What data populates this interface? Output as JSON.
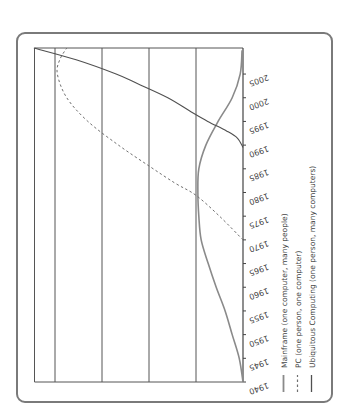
{
  "chart_data": {
    "type": "line",
    "orientation": "rotated-90-ccw",
    "title": "",
    "xlabel": "",
    "ylabel": "",
    "x": [
      1940,
      1945,
      1950,
      1955,
      1960,
      1965,
      1970,
      1975,
      1980,
      1985,
      1990,
      1995,
      2000,
      2005,
      2010
    ],
    "xticks": [
      "1940",
      "1945",
      "1950",
      "1955",
      "1960",
      "1965",
      "1970",
      "1975",
      "1980",
      "1985",
      "1990",
      "1995",
      "2000",
      "2005"
    ],
    "xlim": [
      1940,
      2010.5
    ],
    "ylim": [
      0,
      4.45
    ],
    "grid": {
      "y_gridlines": [
        1,
        2,
        3,
        4
      ]
    },
    "legend_position": "right (rotated, below axis labels)",
    "series": [
      {
        "name": "Mainframe (one computer, many people)",
        "style": "solid-light",
        "color": "#8a8a8a",
        "points": [
          [
            1940,
            0
          ],
          [
            1945,
            0.08
          ],
          [
            1950,
            0.23
          ],
          [
            1955,
            0.38
          ],
          [
            1960,
            0.57
          ],
          [
            1965,
            0.74
          ],
          [
            1970,
            0.89
          ],
          [
            1975,
            0.94
          ],
          [
            1980,
            0.96
          ],
          [
            1985,
            0.94
          ],
          [
            1990,
            0.79
          ],
          [
            1995,
            0.53
          ],
          [
            2000,
            0.23
          ],
          [
            2005,
            0.06
          ],
          [
            2010,
            0.02
          ]
        ]
      },
      {
        "name": "PC (one person, one computer)",
        "style": "dashed",
        "color": "#777777",
        "points": [
          [
            1970,
            0
          ],
          [
            1975,
            0.5
          ],
          [
            1979.4,
            1.0
          ],
          [
            1982,
            1.45
          ],
          [
            1985.6,
            2.0
          ],
          [
            1990,
            2.65
          ],
          [
            1995,
            3.3
          ],
          [
            2000,
            3.75
          ],
          [
            2005,
            3.95
          ],
          [
            2008,
            3.9
          ],
          [
            2010.5,
            3.75
          ]
        ]
      },
      {
        "name": "Ubiquitous Computing (one person, many computers)",
        "style": "solid-dark",
        "color": "#555555",
        "points": [
          [
            1989.5,
            0
          ],
          [
            1991.5,
            0.12
          ],
          [
            1993,
            0.35
          ],
          [
            1995,
            0.75
          ],
          [
            1997,
            1.1
          ],
          [
            2000,
            1.6
          ],
          [
            2003,
            2.25
          ],
          [
            2005,
            2.7
          ],
          [
            2008,
            3.55
          ],
          [
            2010.5,
            4.45
          ]
        ]
      }
    ]
  }
}
